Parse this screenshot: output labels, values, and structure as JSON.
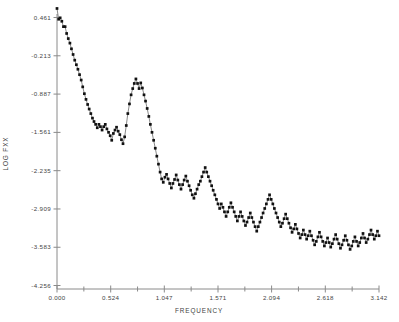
{
  "chart_data": {
    "type": "scatter",
    "title": "",
    "xlabel": "FREQUENCY",
    "ylabel": "LOG FXX",
    "xlim": [
      0.0,
      3.142
    ],
    "ylim": [
      -4.256,
      0.461
    ],
    "grid": false,
    "legend": null,
    "line_connected": true,
    "marker": "square",
    "marker_color": "#111111",
    "line_color": "#555555",
    "axis_color": "#808080",
    "xticks": [
      "0.000",
      "0.524",
      "1.047",
      "1.571",
      "2.094",
      "2.618",
      "3.142"
    ],
    "xtick_values": [
      0.0,
      0.524,
      1.047,
      1.571,
      2.094,
      2.618,
      3.142
    ],
    "xminor_ticks": [
      0.262,
      0.786,
      1.309,
      1.833,
      2.356,
      2.88
    ],
    "yticks": [
      "0.461",
      "-0.213",
      "-0.887",
      "-1.561",
      "-2.235",
      "-2.909",
      "-3.583",
      "-4.256"
    ],
    "ytick_values": [
      0.461,
      -0.213,
      -0.887,
      -1.561,
      -2.235,
      -2.909,
      -3.583,
      -4.256
    ],
    "x": [
      0.0,
      0.016,
      0.031,
      0.047,
      0.063,
      0.079,
      0.094,
      0.11,
      0.126,
      0.141,
      0.157,
      0.173,
      0.189,
      0.204,
      0.22,
      0.236,
      0.251,
      0.267,
      0.283,
      0.299,
      0.314,
      0.33,
      0.346,
      0.361,
      0.377,
      0.393,
      0.409,
      0.424,
      0.44,
      0.456,
      0.471,
      0.487,
      0.503,
      0.519,
      0.534,
      0.55,
      0.566,
      0.581,
      0.597,
      0.613,
      0.629,
      0.644,
      0.66,
      0.676,
      0.691,
      0.707,
      0.723,
      0.739,
      0.754,
      0.77,
      0.786,
      0.801,
      0.817,
      0.833,
      0.849,
      0.864,
      0.88,
      0.896,
      0.911,
      0.927,
      0.943,
      0.959,
      0.974,
      0.99,
      1.006,
      1.021,
      1.037,
      1.053,
      1.069,
      1.084,
      1.1,
      1.116,
      1.131,
      1.147,
      1.163,
      1.179,
      1.194,
      1.21,
      1.226,
      1.241,
      1.257,
      1.273,
      1.289,
      1.304,
      1.32,
      1.336,
      1.351,
      1.367,
      1.383,
      1.399,
      1.414,
      1.43,
      1.446,
      1.461,
      1.477,
      1.493,
      1.509,
      1.524,
      1.54,
      1.556,
      1.571,
      1.587,
      1.603,
      1.619,
      1.634,
      1.65,
      1.666,
      1.681,
      1.697,
      1.713,
      1.729,
      1.744,
      1.76,
      1.776,
      1.791,
      1.807,
      1.823,
      1.839,
      1.854,
      1.87,
      1.886,
      1.901,
      1.917,
      1.933,
      1.949,
      1.964,
      1.98,
      1.996,
      2.011,
      2.027,
      2.043,
      2.059,
      2.074,
      2.09,
      2.106,
      2.121,
      2.137,
      2.153,
      2.169,
      2.184,
      2.2,
      2.216,
      2.231,
      2.247,
      2.263,
      2.279,
      2.294,
      2.31,
      2.326,
      2.341,
      2.357,
      2.373,
      2.389,
      2.404,
      2.42,
      2.436,
      2.451,
      2.467,
      2.483,
      2.499,
      2.514,
      2.53,
      2.546,
      2.561,
      2.577,
      2.593,
      2.609,
      2.624,
      2.64,
      2.656,
      2.671,
      2.687,
      2.703,
      2.719,
      2.734,
      2.75,
      2.766,
      2.781,
      2.797,
      2.813,
      2.829,
      2.844,
      2.86,
      2.876,
      2.891,
      2.907,
      2.923,
      2.939,
      2.954,
      2.97,
      2.986,
      3.001,
      3.017,
      3.033,
      3.049,
      3.064,
      3.08,
      3.096,
      3.111,
      3.127,
      3.142
    ],
    "y": [
      0.62,
      0.43,
      0.455,
      0.395,
      0.3,
      0.3,
      0.18,
      0.09,
      0.01,
      -0.09,
      -0.19,
      -0.29,
      -0.37,
      -0.45,
      -0.545,
      -0.64,
      -0.76,
      -0.88,
      -0.98,
      -1.07,
      -1.15,
      -1.23,
      -1.31,
      -1.37,
      -1.42,
      -1.48,
      -1.42,
      -1.46,
      -1.52,
      -1.46,
      -1.42,
      -1.5,
      -1.56,
      -1.62,
      -1.7,
      -1.58,
      -1.52,
      -1.47,
      -1.54,
      -1.6,
      -1.69,
      -1.76,
      -1.64,
      -1.44,
      -1.23,
      -1.06,
      -0.9,
      -0.79,
      -0.7,
      -0.62,
      -0.7,
      -0.79,
      -0.69,
      -0.78,
      -0.9,
      -1.01,
      -1.14,
      -1.28,
      -1.42,
      -1.56,
      -1.7,
      -1.84,
      -1.98,
      -2.12,
      -2.26,
      -2.38,
      -2.44,
      -2.35,
      -2.3,
      -2.38,
      -2.46,
      -2.54,
      -2.46,
      -2.39,
      -2.31,
      -2.4,
      -2.48,
      -2.56,
      -2.48,
      -2.4,
      -2.33,
      -2.42,
      -2.5,
      -2.58,
      -2.66,
      -2.72,
      -2.64,
      -2.56,
      -2.48,
      -2.42,
      -2.34,
      -2.26,
      -2.18,
      -2.26,
      -2.34,
      -2.42,
      -2.5,
      -2.58,
      -2.66,
      -2.74,
      -2.82,
      -2.9,
      -2.82,
      -2.88,
      -2.96,
      -3.04,
      -2.96,
      -2.88,
      -2.8,
      -2.88,
      -2.96,
      -3.04,
      -3.12,
      -3.04,
      -2.96,
      -3.04,
      -3.12,
      -3.2,
      -3.14,
      -3.06,
      -2.98,
      -3.06,
      -3.14,
      -3.22,
      -3.3,
      -3.22,
      -3.14,
      -3.06,
      -2.98,
      -2.9,
      -2.82,
      -2.74,
      -2.66,
      -2.74,
      -2.82,
      -2.9,
      -2.98,
      -3.06,
      -3.14,
      -3.22,
      -3.16,
      -3.08,
      -3.0,
      -3.08,
      -3.16,
      -3.24,
      -3.32,
      -3.26,
      -3.18,
      -3.26,
      -3.34,
      -3.42,
      -3.36,
      -3.28,
      -3.36,
      -3.44,
      -3.38,
      -3.3,
      -3.38,
      -3.46,
      -3.54,
      -3.48,
      -3.4,
      -3.32,
      -3.4,
      -3.48,
      -3.56,
      -3.5,
      -3.42,
      -3.5,
      -3.58,
      -3.52,
      -3.44,
      -3.36,
      -3.44,
      -3.52,
      -3.6,
      -3.54,
      -3.46,
      -3.38,
      -3.46,
      -3.54,
      -3.62,
      -3.56,
      -3.48,
      -3.4,
      -3.48,
      -3.56,
      -3.5,
      -3.42,
      -3.34,
      -3.42,
      -3.5,
      -3.44,
      -3.36,
      -3.28,
      -3.36,
      -3.44,
      -3.38,
      -3.3,
      -3.38,
      -3.46,
      -3.4,
      -3.32,
      -3.4,
      -3.48,
      -3.42,
      -3.34,
      -3.42,
      -3.5,
      -3.44
    ]
  }
}
